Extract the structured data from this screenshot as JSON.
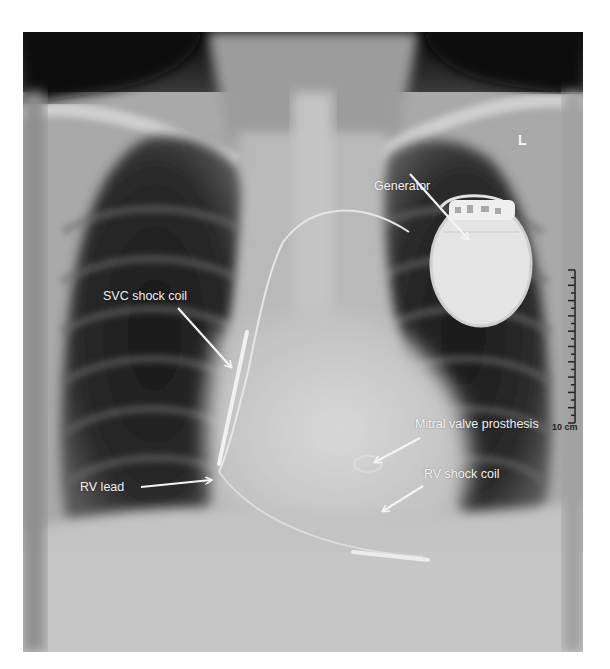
{
  "image": {
    "description": "Chest radiograph (PA view) showing implanted cardioverter-defibrillator with leads and mitral valve prosthesis",
    "side_marker": "L",
    "scale_bar": {
      "label": "10 cm",
      "major_ticks": 10
    }
  },
  "annotations": [
    {
      "id": "generator",
      "label": "Generator"
    },
    {
      "id": "svc-shock-coil",
      "label": "SVC shock coil"
    },
    {
      "id": "mitral-valve-prosthesis",
      "label": "Mitral valve prosthesis"
    },
    {
      "id": "rv-shock-coil",
      "label": "RV shock coil"
    },
    {
      "id": "rv-lead",
      "label": "RV lead"
    }
  ],
  "colors": {
    "background": "#ffffff",
    "annotation_text": "#f2f2f2",
    "lung_dark": "#1c1c1c",
    "mediastinum": "#c9c9c9"
  }
}
